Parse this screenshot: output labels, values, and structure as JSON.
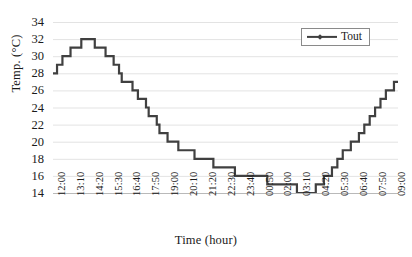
{
  "chart_data": {
    "type": "line",
    "title": "",
    "xlabel": "Time (hour)",
    "ylabel": "Temp. (°C)",
    "ylim": [
      14,
      34
    ],
    "ytick_step": 2,
    "yticks": [
      14,
      16,
      18,
      20,
      22,
      24,
      26,
      28,
      30,
      32,
      34
    ],
    "grid": "horizontal",
    "legend_position": "top-right",
    "legend": [
      "Tout"
    ],
    "line_color": "#404040",
    "grid_color": "#e3e3e3",
    "axis_color": "#b9b9b9",
    "x_tick_interval_minutes": 70,
    "x_sample_interval_minutes": 10,
    "xtick_labels": [
      "12:00",
      "13:10",
      "14:20",
      "15:30",
      "16:40",
      "17:50",
      "19:00",
      "20:10",
      "21:20",
      "22:30",
      "23:40",
      "00:50",
      "02:00",
      "03:10",
      "04:20",
      "05:30",
      "06:40",
      "07:50",
      "09:00",
      "10:10",
      "11:20"
    ],
    "series": [
      {
        "name": "Tout",
        "marker": "diamond",
        "values": [
          28,
          28,
          29,
          29,
          30,
          30,
          30,
          31,
          31,
          31,
          31,
          32,
          32,
          32,
          32,
          32,
          31,
          31,
          31,
          31,
          30,
          30,
          30,
          29,
          29,
          28,
          27,
          27,
          27,
          27,
          26,
          26,
          25,
          25,
          25,
          24,
          23,
          23,
          23,
          22,
          21,
          21,
          21,
          20,
          20,
          20,
          20,
          19,
          19,
          19,
          19,
          19,
          19,
          18,
          18,
          18,
          18,
          18,
          18,
          18,
          17,
          17,
          17,
          17,
          17,
          17,
          17,
          17,
          16,
          16,
          16,
          16,
          16,
          16,
          16,
          16,
          16,
          16,
          16,
          16,
          15,
          15,
          15,
          15,
          15,
          15,
          15,
          15,
          15,
          15,
          15,
          14,
          14,
          14,
          14,
          14,
          14,
          14,
          15,
          15,
          15,
          16,
          16,
          16,
          17,
          17,
          18,
          18,
          19,
          19,
          19,
          20,
          20,
          20,
          21,
          21,
          22,
          22,
          23,
          23,
          24,
          24,
          25,
          25,
          26,
          26,
          26,
          27,
          27
        ]
      }
    ]
  }
}
